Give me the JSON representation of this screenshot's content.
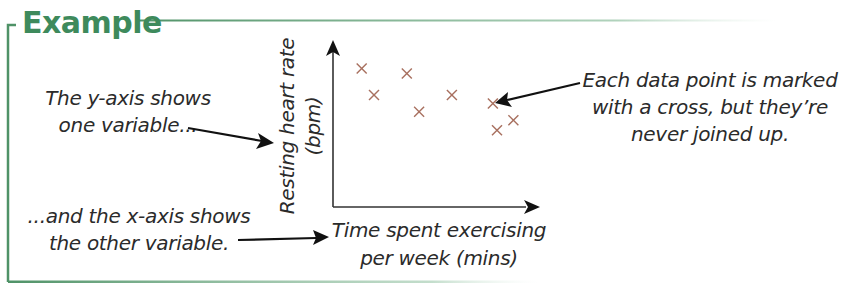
{
  "heading": "Example",
  "annotations": {
    "y_axis_note": [
      "The y-axis shows",
      "one variable..."
    ],
    "x_axis_note": [
      "...and the x-axis shows",
      "the other variable."
    ],
    "points_note": [
      "Each data point is marked",
      "with a cross, but they’re",
      "never joined up."
    ]
  },
  "colors": {
    "frame": "#5a9a70",
    "heading": "#3e8a5c",
    "marker": "#a8705f",
    "axis": "#222222",
    "text": "#2b2b2b"
  },
  "chart_data": {
    "type": "scatter",
    "title": "",
    "xlabel": "Time spent exercising per week (mins)",
    "ylabel": "Resting heart rate (bpm)",
    "xlabel_lines": [
      "Time spent exercising",
      "per week (mins)"
    ],
    "ylabel_lines": [
      "Resting heart rate",
      "(bpm)"
    ],
    "marker": "cross",
    "grid": false,
    "legend": null,
    "xlim": [
      0,
      100
    ],
    "ylim": [
      0,
      100
    ],
    "x_ticks": [],
    "y_ticks": [],
    "points": [
      {
        "x": 14,
        "y": 83
      },
      {
        "x": 20,
        "y": 67
      },
      {
        "x": 36,
        "y": 80
      },
      {
        "x": 42,
        "y": 57
      },
      {
        "x": 58,
        "y": 67
      },
      {
        "x": 78,
        "y": 62
      },
      {
        "x": 88,
        "y": 52
      },
      {
        "x": 80,
        "y": 46
      }
    ]
  }
}
